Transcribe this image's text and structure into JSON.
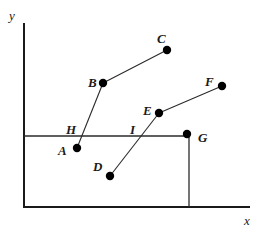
{
  "diagram": {
    "axes": {
      "x_label": "x",
      "y_label": "y"
    },
    "points": [
      {
        "id": "A",
        "label": "A",
        "cx": 77,
        "cy": 148,
        "lx": 58,
        "ly": 155
      },
      {
        "id": "B",
        "label": "B",
        "cx": 103,
        "cy": 83,
        "lx": 88,
        "ly": 87
      },
      {
        "id": "C",
        "label": "C",
        "cx": 167,
        "cy": 50,
        "lx": 157,
        "ly": 43
      },
      {
        "id": "D",
        "label": "D",
        "cx": 110,
        "cy": 176,
        "lx": 93,
        "ly": 171
      },
      {
        "id": "E",
        "label": "E",
        "cx": 159,
        "cy": 113,
        "lx": 143,
        "ly": 115
      },
      {
        "id": "F",
        "label": "F",
        "cx": 222,
        "cy": 86,
        "lx": 205,
        "ly": 86
      },
      {
        "id": "G",
        "label": "G",
        "cx": 187,
        "cy": 134,
        "lx": 198,
        "ly": 142
      }
    ],
    "markers": [
      {
        "id": "H",
        "label": "H",
        "lx": 66,
        "ly": 134
      },
      {
        "id": "I",
        "label": "I",
        "lx": 130,
        "ly": 134
      }
    ],
    "segments": [
      {
        "from": "A",
        "to": "B"
      },
      {
        "from": "B",
        "to": "C"
      },
      {
        "from": "D",
        "to": "E"
      },
      {
        "from": "E",
        "to": "F"
      }
    ],
    "guides": {
      "horizontal_y": 136,
      "vertical_x": 189
    }
  }
}
